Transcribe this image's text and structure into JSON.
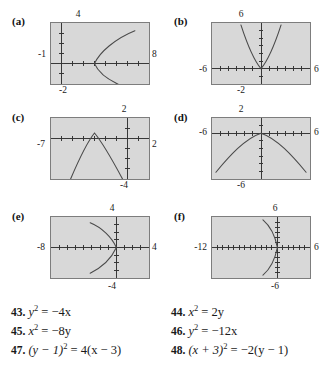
{
  "figure": {
    "panels": [
      {
        "letter": "(a)",
        "axis_labels": {
          "top": "4",
          "bottom": "-2",
          "left": "-1",
          "right": "8"
        },
        "window": {
          "xmin": -1,
          "xmax": 8,
          "ymin": -2,
          "ymax": 4
        },
        "curve": "rightward-parabola-vertex-3-0"
      },
      {
        "letter": "(b)",
        "axis_labels": {
          "top": "6",
          "bottom": "-2",
          "left": "-6",
          "right": "6"
        },
        "window": {
          "xmin": -6,
          "xmax": 6,
          "ymin": -2,
          "ymax": 6
        },
        "curve": "upward-parabola-vertex-0-0"
      },
      {
        "letter": "(c)",
        "axis_labels": {
          "top": "2",
          "bottom": "-4",
          "left": "-7",
          "right": "2"
        },
        "window": {
          "xmin": -7,
          "xmax": 2,
          "ymin": -4,
          "ymax": 2
        },
        "curve": "downward-parabola-vertex-neg3-1"
      },
      {
        "letter": "(d)",
        "axis_labels": {
          "top": "2",
          "bottom": "-6",
          "left": "-6",
          "right": "6"
        },
        "window": {
          "xmin": -6,
          "xmax": 6,
          "ymin": -6,
          "ymax": 2
        },
        "curve": "downward-wide-parabola-vertex-0-0"
      },
      {
        "letter": "(e)",
        "axis_labels": {
          "top": "4",
          "bottom": "-4",
          "left": "-8",
          "right": "4"
        },
        "window": {
          "xmin": -8,
          "xmax": 4,
          "ymin": -4,
          "ymax": 4
        },
        "curve": "leftward-parabola-vertex-0-0"
      },
      {
        "letter": "(f)",
        "axis_labels": {
          "top": "6",
          "bottom": "-6",
          "left": "-12",
          "right": "6"
        },
        "window": {
          "xmin": -12,
          "xmax": 6,
          "ymin": -6,
          "ymax": 6
        },
        "curve": "leftward-narrow-parabola-vertex-0-0"
      }
    ]
  },
  "exercises": {
    "column_left": [
      {
        "number": "43.",
        "lhs_var": "y",
        "lhs_exp": "2",
        "rhs": "= −4x"
      },
      {
        "number": "45.",
        "lhs_var": "x",
        "lhs_exp": "2",
        "rhs": "= −8y"
      },
      {
        "number": "47.",
        "lhs": "(y − 1)",
        "exp": "2",
        "rhs": "= 4(x − 3)"
      }
    ],
    "column_right": [
      {
        "number": "44.",
        "lhs_var": "x",
        "lhs_exp": "2",
        "rhs": "= 2y"
      },
      {
        "number": "46.",
        "lhs_var": "y",
        "lhs_exp": "2",
        "rhs": "= −12x"
      },
      {
        "number": "48.",
        "lhs": "(x + 3)",
        "exp": "2",
        "rhs": "= −2(y − 1)"
      }
    ],
    "items": [
      "43. y² = −4x",
      "44. x² = 2y",
      "45. x² = −8y",
      "46. y² = −12x",
      "47. (y − 1)² = 4(x − 3)",
      "48. (x + 3)² = −2(y − 1)"
    ]
  },
  "colors": {
    "screen_background": "#d8d8d8",
    "screen_border": "#7d7d7d",
    "axis": "#333333",
    "curve": "#4a4a4a",
    "page_background": "#ffffff",
    "text": "#1a1a1a"
  }
}
